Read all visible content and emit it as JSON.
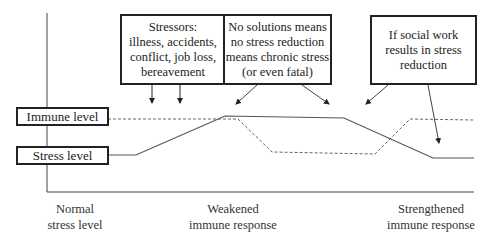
{
  "callouts": {
    "stressors": {
      "lines": [
        "Stressors:",
        "illness, accidents,",
        "conflict, job loss,",
        "bereavement"
      ]
    },
    "no_solutions": {
      "lines": [
        "No solutions means",
        "no stress reduction",
        "means chronic stress",
        "(or even fatal)"
      ]
    },
    "social_work": {
      "lines": [
        "If social work",
        "results in stress",
        "reduction"
      ]
    }
  },
  "legend": {
    "immune_level": "Immune level",
    "stress_level": "Stress level"
  },
  "x_axis_labels": {
    "normal": [
      "Normal",
      "stress level"
    ],
    "weakened": [
      "Weakened",
      "immune response"
    ],
    "strengthened": [
      "Strengthened",
      "immune response"
    ]
  },
  "series": {
    "stress_level": {
      "style": "solid",
      "color": "#555555"
    },
    "immune_level": {
      "style": "dashed",
      "color": "#666666"
    }
  }
}
